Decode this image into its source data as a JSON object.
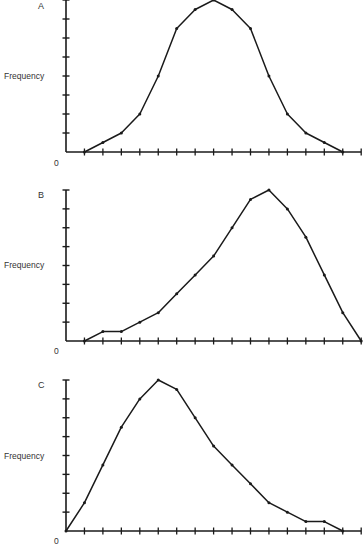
{
  "chart_data": [
    {
      "type": "line",
      "panel_label": "A",
      "title": "A",
      "ylabel": "Frequency",
      "xlabel": "",
      "origin_label": "0",
      "x_ticks": 16,
      "y_ticks": 8,
      "ylim": [
        0,
        8
      ],
      "grid": false,
      "legend": null,
      "x": [
        1,
        2,
        3,
        4,
        5,
        6,
        7,
        8,
        9,
        10,
        11,
        12,
        13,
        14,
        15
      ],
      "values": [
        0,
        0.5,
        1,
        2,
        4,
        6.5,
        7.5,
        8,
        7.5,
        6.5,
        4,
        2,
        1,
        0.5,
        0
      ],
      "shape": "symmetric (normal)"
    },
    {
      "type": "line",
      "panel_label": "B",
      "title": "B",
      "ylabel": "Frequency",
      "xlabel": "",
      "origin_label": "0",
      "x_ticks": 16,
      "y_ticks": 8,
      "ylim": [
        0,
        8
      ],
      "grid": false,
      "legend": null,
      "x": [
        1,
        2,
        3,
        4,
        5,
        6,
        7,
        8,
        9,
        10,
        11,
        12,
        13,
        14,
        15,
        16
      ],
      "values": [
        0,
        0.5,
        0.5,
        1,
        1.5,
        2.5,
        3.5,
        4.5,
        6,
        7.5,
        8,
        7,
        5.5,
        3.5,
        1.5,
        0
      ],
      "shape": "negatively skewed"
    },
    {
      "type": "line",
      "panel_label": "C",
      "title": "C",
      "ylabel": "Frequency",
      "xlabel": "",
      "origin_label": "0",
      "x_ticks": 16,
      "y_ticks": 8,
      "ylim": [
        0,
        8
      ],
      "grid": false,
      "legend": null,
      "x": [
        0,
        1,
        2,
        3,
        4,
        5,
        6,
        7,
        8,
        9,
        10,
        11,
        12,
        13,
        14,
        15
      ],
      "values": [
        0,
        1.5,
        3.5,
        5.5,
        7,
        8,
        7.5,
        6,
        4.5,
        3.5,
        2.5,
        1.5,
        1,
        0.5,
        0.5,
        0
      ],
      "shape": "positively skewed"
    }
  ],
  "panels": [
    {
      "label": "A",
      "ylabel": "Frequency",
      "origin": "0"
    },
    {
      "label": "B",
      "ylabel": "Frequency",
      "origin": "0"
    },
    {
      "label": "C",
      "ylabel": "Frequency",
      "origin": "0"
    }
  ],
  "style": {
    "line_color": "#1a1a1a",
    "axis_color": "#1a1a1a",
    "text_color": "#333333",
    "background": "#ffffff"
  }
}
